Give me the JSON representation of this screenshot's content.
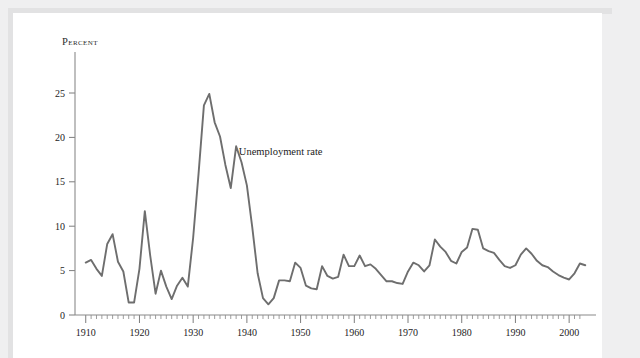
{
  "figure": {
    "y_axis_caption": "Percent",
    "annotation": "Unemployment rate"
  },
  "colors": {
    "line": "#6e6e6e",
    "axis": "#8a8a8a",
    "text": "#242424",
    "page": "#ffffff",
    "backdrop": "#efeff0"
  },
  "chart_data": {
    "type": "line",
    "title": "",
    "xlabel": "",
    "ylabel": "Percent",
    "xlim": [
      1908,
      2005
    ],
    "ylim": [
      0,
      27
    ],
    "grid": false,
    "legend": "none",
    "annotations": [
      {
        "text": "Unemployment rate",
        "x": 1938.5,
        "y": 18.0
      }
    ],
    "y_ticks": [
      0,
      5,
      10,
      15,
      20,
      25
    ],
    "x_ticks_major": [
      1910,
      1920,
      1930,
      1940,
      1950,
      1960,
      1970,
      1980,
      1990,
      2000
    ],
    "x_tick_minor_step": 1,
    "series": [
      {
        "name": "Unemployment rate",
        "x": [
          1910,
          1911,
          1912,
          1913,
          1914,
          1915,
          1916,
          1917,
          1918,
          1919,
          1920,
          1921,
          1922,
          1923,
          1924,
          1925,
          1926,
          1927,
          1928,
          1929,
          1930,
          1931,
          1932,
          1933,
          1934,
          1935,
          1936,
          1937,
          1938,
          1939,
          1940,
          1941,
          1942,
          1943,
          1944,
          1945,
          1946,
          1947,
          1948,
          1949,
          1950,
          1951,
          1952,
          1953,
          1954,
          1955,
          1956,
          1957,
          1958,
          1959,
          1960,
          1961,
          1962,
          1963,
          1964,
          1965,
          1966,
          1967,
          1968,
          1969,
          1970,
          1971,
          1972,
          1973,
          1974,
          1975,
          1976,
          1977,
          1978,
          1979,
          1980,
          1981,
          1982,
          1983,
          1984,
          1985,
          1986,
          1987,
          1988,
          1989,
          1990,
          1991,
          1992,
          1993,
          1994,
          1995,
          1996,
          1997,
          1998,
          1999,
          2000,
          2001,
          2002,
          2003
        ],
        "values": [
          5.9,
          6.2,
          5.2,
          4.4,
          8.0,
          9.1,
          6.0,
          4.9,
          1.4,
          1.4,
          5.2,
          11.7,
          6.7,
          2.4,
          5.0,
          3.2,
          1.8,
          3.3,
          4.2,
          3.2,
          8.7,
          15.9,
          23.6,
          24.9,
          21.7,
          20.1,
          16.9,
          14.3,
          19.0,
          17.2,
          14.6,
          9.9,
          4.7,
          1.9,
          1.2,
          1.9,
          3.9,
          3.9,
          3.8,
          5.9,
          5.3,
          3.3,
          3.0,
          2.9,
          5.5,
          4.4,
          4.1,
          4.3,
          6.8,
          5.5,
          5.5,
          6.7,
          5.5,
          5.7,
          5.2,
          4.5,
          3.8,
          3.8,
          3.6,
          3.5,
          4.9,
          5.9,
          5.6,
          4.9,
          5.6,
          8.5,
          7.7,
          7.1,
          6.1,
          5.8,
          7.1,
          7.6,
          9.7,
          9.6,
          7.5,
          7.2,
          7.0,
          6.2,
          5.5,
          5.3,
          5.6,
          6.8,
          7.5,
          6.9,
          6.1,
          5.6,
          5.4,
          4.9,
          4.5,
          4.2,
          4.0,
          4.7,
          5.8,
          5.6
        ]
      }
    ]
  }
}
